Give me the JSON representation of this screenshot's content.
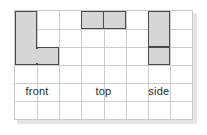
{
  "figure": {
    "kind": "orthographic-views-on-grid",
    "background_color": "#ffffff",
    "panel": {
      "x": 14,
      "y": 10,
      "width": 179,
      "height": 110,
      "border_color": "#c9c9c9",
      "shadow_color": "#cfcfcf"
    },
    "grid": {
      "columns": 8,
      "rows": 6,
      "cell_size": 22,
      "line_color": "#cccccc",
      "visible": true
    },
    "shape_style": {
      "fill_color": "#d6d6d6",
      "outline_color": "#4a4a4a",
      "outline_width": 1.6
    }
  },
  "shapes": [
    {
      "name": "front-view-shape",
      "description": "L-shaped front view",
      "unit_cells": [
        [
          1,
          1
        ],
        [
          1,
          2
        ],
        [
          1,
          3
        ],
        [
          2,
          3
        ]
      ],
      "parts": [
        {
          "col": 1,
          "row": 1,
          "cols": 1,
          "rows": 3
        },
        {
          "col": 2,
          "row": 3,
          "cols": 1,
          "rows": 1
        }
      ],
      "dividers": []
    },
    {
      "name": "top-view-shape",
      "description": "Two squares side by side",
      "unit_cells": [
        [
          4,
          1
        ],
        [
          5,
          1
        ]
      ],
      "parts": [
        {
          "col": 4,
          "row": 1,
          "cols": 2,
          "rows": 1
        }
      ],
      "dividers": [
        {
          "orient": "v",
          "at": 1
        }
      ]
    },
    {
      "name": "side-view-shape",
      "description": "Vertical bar three cells tall",
      "unit_cells": [
        [
          7,
          1
        ],
        [
          7,
          2
        ],
        [
          7,
          3
        ]
      ],
      "parts": [
        {
          "col": 7,
          "row": 1,
          "cols": 1,
          "rows": 3
        }
      ],
      "dividers": [
        {
          "orient": "h",
          "at": 2
        }
      ]
    }
  ],
  "labels": {
    "front": "front",
    "top": "top",
    "side": "side"
  }
}
